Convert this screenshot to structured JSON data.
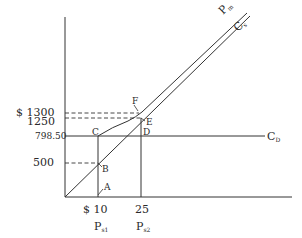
{
  "diagram": {
    "colors": {
      "ink": "#2a2a2a",
      "background": "#ffffff"
    },
    "y_ticks": {
      "t1300": "$ 1300",
      "t1250": "1250",
      "t798": "798.50",
      "t500": "500"
    },
    "x_ticks": {
      "t10": "$ 10",
      "t25": "25"
    },
    "x_labels": {
      "ps1_main": "P",
      "ps1_sub": "s1",
      "ps2_main": "P",
      "ps2_sub": "s2"
    },
    "points": {
      "A": "A",
      "B": "B",
      "C": "C",
      "D": "D",
      "E": "E",
      "F": "F"
    },
    "curves": {
      "pm_main": "P",
      "pm_sub": "m",
      "cs_main": "C",
      "cs_sub": "s",
      "cd_main": "C",
      "cd_sub": "D"
    }
  }
}
